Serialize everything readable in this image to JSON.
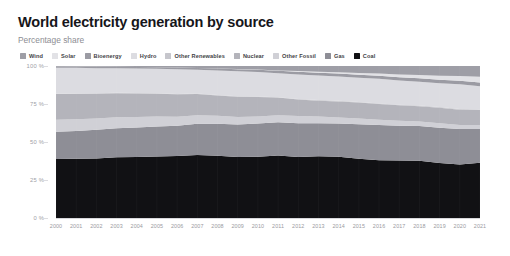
{
  "header": {
    "title": "World electricity generation by source",
    "subtitle": "Percentage share"
  },
  "legend": {
    "position": "top",
    "items": [
      {
        "label": "Wind",
        "color": "#9e9ea6"
      },
      {
        "label": "Solar",
        "color": "#e2e2e6"
      },
      {
        "label": "Bioenergy",
        "color": "#9b9ba3"
      },
      {
        "label": "Hydro",
        "color": "#dcdce1"
      },
      {
        "label": "Other Renewables",
        "color": "#c6c6cc"
      },
      {
        "label": "Nuclear",
        "color": "#b4b4bb"
      },
      {
        "label": "Other Fossil",
        "color": "#d0d0d6"
      },
      {
        "label": "Gas",
        "color": "#8e8e96"
      },
      {
        "label": "Coal",
        "color": "#111114"
      }
    ]
  },
  "axes": {
    "y_ticks": [
      "0 %",
      "25 %",
      "50 %",
      "75 %",
      "100 %"
    ],
    "y_values": [
      0,
      25,
      50,
      75,
      100
    ],
    "x_ticks": [
      "2000",
      "2001",
      "2002",
      "2003",
      "2004",
      "2005",
      "2006",
      "2007",
      "2008",
      "2009",
      "2010",
      "2011",
      "2012",
      "2013",
      "2014",
      "2015",
      "2016",
      "2017",
      "2018",
      "2019",
      "2020",
      "2021"
    ]
  },
  "chart_data": {
    "type": "area",
    "stacked": true,
    "normalized": true,
    "title": "World electricity generation by source",
    "subtitle": "Percentage share",
    "xlabel": "",
    "ylabel": "Percentage share",
    "ylim": [
      0,
      100
    ],
    "xlim": [
      2000,
      2021
    ],
    "grid": true,
    "legend_position": "top",
    "x": [
      2000,
      2001,
      2002,
      2003,
      2004,
      2005,
      2006,
      2007,
      2008,
      2009,
      2010,
      2011,
      2012,
      2013,
      2014,
      2015,
      2016,
      2017,
      2018,
      2019,
      2020,
      2021
    ],
    "series": [
      {
        "name": "Coal",
        "color": "#111114",
        "values": [
          38.8,
          38.9,
          39.2,
          40.1,
          40.3,
          40.7,
          41.1,
          41.8,
          41.2,
          40.5,
          40.6,
          41.3,
          40.6,
          41.0,
          40.7,
          39.2,
          38.2,
          38.1,
          38.0,
          36.6,
          35.3,
          36.1
        ]
      },
      {
        "name": "Gas",
        "color": "#8e8e96",
        "values": [
          17.9,
          18.3,
          18.9,
          19.1,
          19.5,
          19.8,
          20.1,
          20.7,
          21.2,
          21.5,
          22.1,
          22.0,
          22.5,
          21.9,
          21.9,
          22.7,
          23.3,
          23.1,
          23.1,
          23.5,
          23.5,
          22.2
        ]
      },
      {
        "name": "Other Fossil",
        "color": "#d0d0d6",
        "values": [
          8.0,
          7.6,
          7.3,
          7.2,
          6.9,
          6.6,
          6.0,
          5.6,
          5.3,
          5.0,
          4.6,
          4.6,
          4.8,
          4.4,
          4.1,
          3.8,
          3.5,
          3.3,
          3.0,
          2.9,
          2.7,
          2.6
        ]
      },
      {
        "name": "Nuclear",
        "color": "#b4b4bb",
        "values": [
          16.8,
          16.7,
          16.4,
          15.9,
          15.7,
          15.2,
          14.8,
          14.0,
          13.5,
          13.4,
          12.9,
          11.7,
          10.9,
          10.6,
          10.6,
          10.6,
          10.4,
          10.3,
          10.1,
          10.4,
          10.1,
          9.8
        ]
      },
      {
        "name": "Other Renewables",
        "color": "#c6c6cc",
        "values": [
          0.3,
          0.3,
          0.3,
          0.3,
          0.3,
          0.3,
          0.3,
          0.3,
          0.3,
          0.3,
          0.3,
          0.3,
          0.4,
          0.4,
          0.4,
          0.4,
          0.4,
          0.4,
          0.4,
          0.4,
          0.4,
          0.4
        ]
      },
      {
        "name": "Hydro",
        "color": "#dcdce1",
        "values": [
          17.1,
          16.8,
          16.5,
          16.1,
          16.1,
          16.1,
          16.3,
          15.8,
          16.2,
          16.6,
          16.3,
          15.8,
          16.3,
          16.3,
          16.2,
          16.0,
          16.3,
          16.1,
          15.8,
          15.9,
          16.4,
          15.2
        ]
      },
      {
        "name": "Bioenergy",
        "color": "#9b9ba3",
        "values": [
          0.9,
          0.9,
          1.0,
          1.0,
          1.1,
          1.1,
          1.2,
          1.2,
          1.3,
          1.4,
          1.5,
          1.6,
          1.7,
          1.8,
          1.9,
          2.0,
          2.1,
          2.2,
          2.3,
          2.3,
          2.4,
          2.4
        ]
      },
      {
        "name": "Solar",
        "color": "#e2e2e6",
        "values": [
          0.0,
          0.0,
          0.0,
          0.0,
          0.0,
          0.0,
          0.0,
          0.0,
          0.1,
          0.1,
          0.2,
          0.3,
          0.5,
          0.7,
          0.9,
          1.1,
          1.4,
          1.8,
          2.2,
          2.6,
          3.1,
          3.7
        ]
      },
      {
        "name": "Wind",
        "color": "#9e9ea6",
        "values": [
          0.2,
          0.3,
          0.4,
          0.5,
          0.6,
          0.8,
          1.0,
          1.3,
          1.6,
          2.0,
          2.3,
          2.9,
          3.4,
          3.8,
          4.1,
          4.6,
          5.0,
          5.6,
          6.0,
          6.5,
          6.6,
          7.1
        ]
      }
    ]
  }
}
